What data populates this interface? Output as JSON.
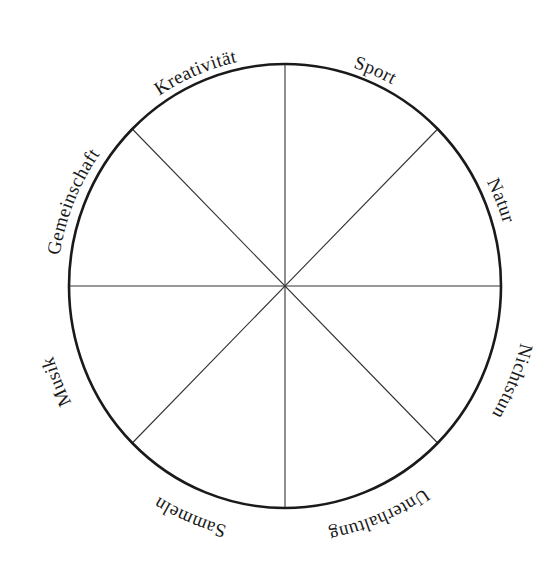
{
  "diagram": {
    "type": "wheel",
    "center": [
      285,
      286
    ],
    "rx": 216,
    "ry": 222,
    "stroke_color": "#1a1a1a",
    "divider_color": "#333333",
    "segments": 8,
    "labels": [
      {
        "text": "Sport",
        "angle": 22.5,
        "direction": "cw"
      },
      {
        "text": "Natur",
        "angle": 67.5,
        "direction": "cw"
      },
      {
        "text": "Musik",
        "angle": 112.5,
        "direction": "ccw"
      },
      {
        "text": "Sammeln",
        "angle": 157.5,
        "direction": "ccw"
      },
      {
        "text": "Unterhaltung",
        "angle": 202.5,
        "direction": "ccw"
      },
      {
        "text": "Nichtstun",
        "angle": 247.5,
        "direction": "ccw"
      },
      {
        "text": "Gemeinschaft",
        "angle": 292.5,
        "direction": "cw"
      },
      {
        "text": "Kreativität",
        "angle": 337.5,
        "direction": "cw"
      }
    ]
  }
}
